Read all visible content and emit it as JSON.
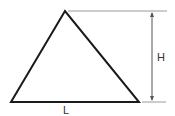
{
  "diagram": {
    "shape": "triangle",
    "labels": {
      "height": "H",
      "base": "L"
    },
    "colors": {
      "stroke": "#1a1a1a",
      "dimension": "#9a9a9a",
      "text": "#333333"
    }
  }
}
